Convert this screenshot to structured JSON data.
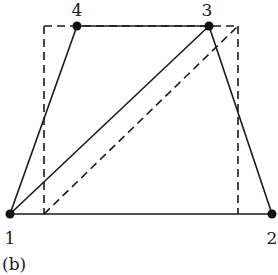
{
  "figure": {
    "panel_label": "(b)",
    "nodes": [
      {
        "id": "1",
        "label": "1",
        "x": 10,
        "y": 214,
        "label_x": 10,
        "label_y": 244
      },
      {
        "id": "2",
        "label": "2",
        "x": 272,
        "y": 214,
        "label_x": 272,
        "label_y": 244
      },
      {
        "id": "3",
        "label": "3",
        "x": 209,
        "y": 26,
        "label_x": 207,
        "label_y": 16
      },
      {
        "id": "4",
        "label": "4",
        "x": 77,
        "y": 26,
        "label_x": 77,
        "label_y": 16
      }
    ],
    "solid_edges": [
      {
        "from": "1",
        "to": "2"
      },
      {
        "from": "2",
        "to": "3"
      },
      {
        "from": "3",
        "to": "4"
      },
      {
        "from": "4",
        "to": "1"
      },
      {
        "from": "1",
        "to": "3"
      }
    ],
    "dashed_rectangle": {
      "left": 44,
      "top": 26,
      "right": 238,
      "bottom": 214
    },
    "dashed_diagonal": {
      "x1": 44,
      "y1": 214,
      "x2": 238,
      "y2": 26
    },
    "colors": {
      "stroke": "#1a1a1a",
      "node": "#111111",
      "background": "#ffffff"
    }
  }
}
